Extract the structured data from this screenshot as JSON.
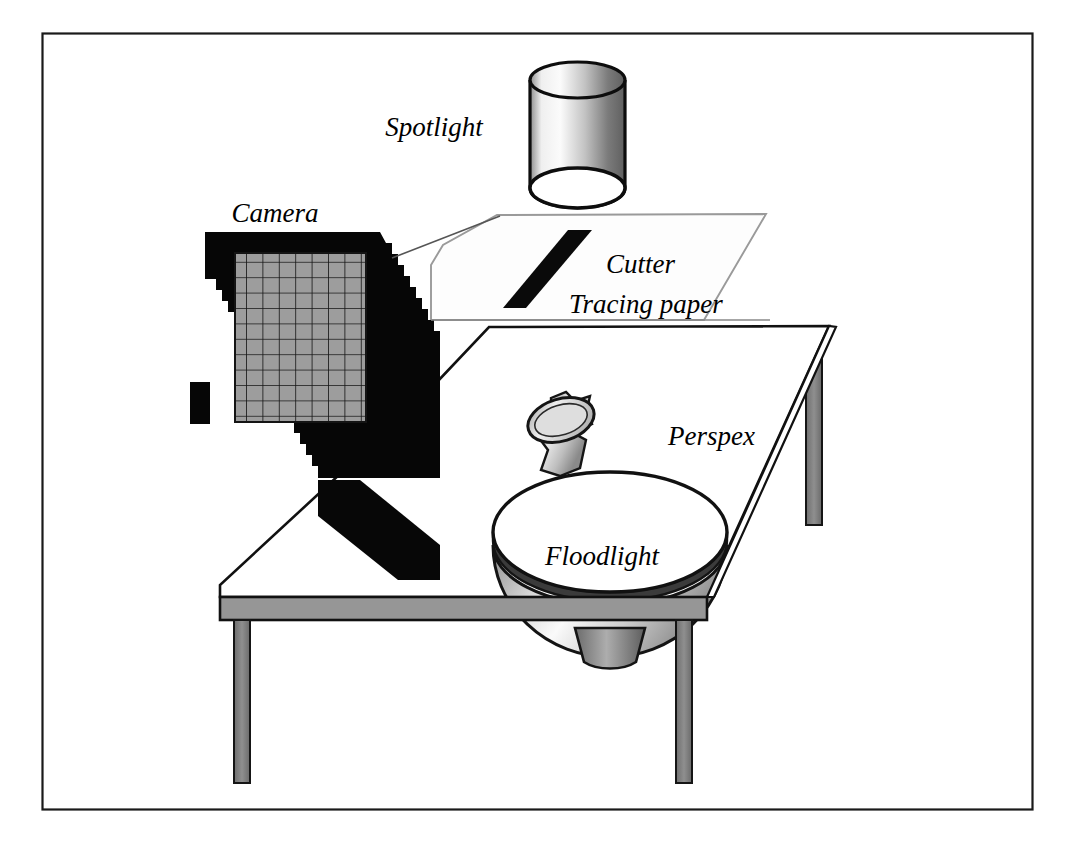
{
  "figure": {
    "kind": "apparatus-diagram",
    "title": "",
    "background_color": "#ffffff",
    "frame": {
      "name": "figure-border",
      "stroke_color": "#1a1a1a",
      "fill_color": "#ffffff"
    }
  },
  "palette": {
    "ink": "#000000",
    "frame_stroke": "#1a1a1a",
    "camera_body": "#050505",
    "sensor_grid_fill": "#9d9d9d",
    "sensor_grid_line": "#101010",
    "table_edge_fill": "#969696",
    "table_leg_fill": "#7e7e7e",
    "table_top_fill": "#ffffff",
    "paper_fill": "#fdfdfd",
    "paper_stroke": "#8c8c8c",
    "cutter_fill": "#0a0a0a",
    "spotlight_light": "#f4f4f4",
    "spotlight_dark": "#6f6f6f",
    "floodlight_fill": "#ffffff",
    "floodlight_shadow": "#3a3a3a",
    "object_fill": "#c9c9c9"
  },
  "labels": {
    "spotlight": "Spotlight",
    "camera": "Camera",
    "cutter": "Cutter",
    "tracing_paper": "Tracing paper",
    "perspex": "Perspex",
    "floodlight": "Floodlight"
  },
  "components": [
    {
      "id": "spotlight",
      "label": "Spotlight",
      "type": "cylinder",
      "description": "Shaded cylindrical lamp housing suspended above the tracing paper",
      "position": {
        "x": 577,
        "y": 132
      }
    },
    {
      "id": "camera",
      "label": "Camera",
      "type": "camera-body-with-sensor-grid",
      "description": "Black camera body with grey gridded sensor panel, on a stand resting on the table",
      "position": {
        "x": 290,
        "y": 340
      },
      "grid": {
        "columns": 8,
        "rows": 11
      }
    },
    {
      "id": "cutter",
      "label": "Cutter",
      "type": "slanted-bar",
      "description": "Black diagonal blade lying on the tracing paper",
      "position": {
        "x": 560,
        "y": 268
      }
    },
    {
      "id": "tracing-paper",
      "label": "Tracing paper",
      "type": "parallelogram-sheet",
      "description": "Translucent sheet in perspective above the table",
      "position": {
        "x": 595,
        "y": 268
      }
    },
    {
      "id": "perspex",
      "label": "Perspex",
      "type": "table-top",
      "description": "Transparent Perspex table surface in perspective",
      "position": {
        "x": 715,
        "y": 430
      }
    },
    {
      "id": "floodlight",
      "label": "Floodlight",
      "type": "dome-lamp",
      "description": "Large domed floodlight set through the Perspex table top",
      "position": {
        "x": 610,
        "y": 550
      }
    },
    {
      "id": "specimen",
      "label": "",
      "type": "small-object",
      "description": "Small grey specimen object standing on the Perspex table",
      "position": {
        "x": 565,
        "y": 435
      }
    }
  ],
  "label_positions": {
    "spotlight": {
      "x": 434,
      "y": 136
    },
    "camera": {
      "x": 275,
      "y": 216
    },
    "cutter": {
      "x": 606,
      "y": 265
    },
    "tracing_paper": {
      "x": 569,
      "y": 305
    },
    "perspex": {
      "x": 668,
      "y": 437
    },
    "floodlight": {
      "x": 545,
      "y": 557
    }
  }
}
